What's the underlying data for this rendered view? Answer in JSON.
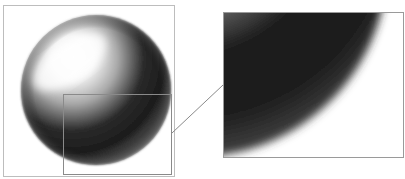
{
  "figure": {
    "colors": {
      "background": "#ffffff",
      "frame": "#bdbdbd",
      "inset_outline": "#8a8a8a",
      "connector": "#8a8a8a",
      "highlight": "#ffffff",
      "midtone": "#9a9a9a",
      "shadow": "#1a1a1a"
    },
    "left_panel": {
      "label": "sphere-overview"
    },
    "right_panel": {
      "label": "zoomed-detail"
    }
  }
}
